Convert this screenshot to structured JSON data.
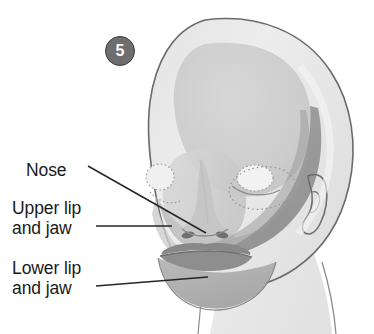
{
  "figure": {
    "number_badge": "5",
    "background_color": "#ffffff"
  },
  "labels": [
    {
      "id": "nose",
      "line1": "Nose",
      "line2": "",
      "text": "Nose"
    },
    {
      "id": "upper",
      "line1": "Upper lip",
      "line2": "and jaw",
      "text": "Upper lip\nand jaw"
    },
    {
      "id": "lower",
      "line1": "Lower lip",
      "line2": "and jaw",
      "text": "Lower lip\nand jaw"
    }
  ],
  "colors": {
    "outline": "#6b6b6b",
    "head_fill": "#e8e8e8",
    "face_fill": "#d0d0d0",
    "cranium_fill": "#c9c9c9",
    "jaw_fill": "#b2b2b2",
    "lip_dark": "#8a8a8a",
    "band_dark": "#9a9a9a",
    "leader_line": "#262626",
    "badge_fill": "#6e6e6e",
    "badge_border": "#3c3c3c",
    "badge_text": "#ffffff",
    "label_text": "#1a1a1a",
    "dotted_eye": "#8e8e8e"
  },
  "leader_lines": {
    "nose": {
      "from_x": 88,
      "from_y": 166,
      "to_x": 206,
      "to_y": 233
    },
    "upper": {
      "from_x": 96,
      "from_y": 226,
      "to_x": 172,
      "to_y": 226
    },
    "lower": {
      "from_x": 96,
      "from_y": 286,
      "to_x": 208,
      "to_y": 277
    }
  }
}
